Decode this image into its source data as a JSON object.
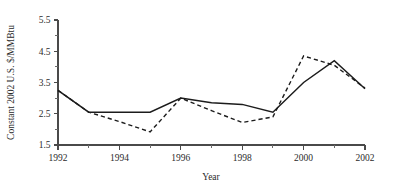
{
  "chart_data": {
    "type": "line",
    "title": "",
    "subtitle": "",
    "xlabel": "Year",
    "ylabel": "Constant 2002 U.S. $/MMBtu",
    "x": [
      1992,
      1993,
      1994,
      1995,
      1996,
      1997,
      1998,
      1999,
      2000,
      2001,
      2002
    ],
    "xlim": [
      1992,
      2002
    ],
    "ylim": [
      1.5,
      5.5
    ],
    "y_ticks": [
      1.5,
      2.5,
      3.5,
      4.5,
      5.5
    ],
    "y_tick_labels": [
      "1.5",
      "2.5",
      "3.5",
      "4.5",
      "5.5"
    ],
    "y_minor_ticks": [
      2.0,
      3.0,
      4.0,
      5.0
    ],
    "x_ticks": [
      1992,
      1994,
      1996,
      1998,
      2000,
      2002
    ],
    "x_tick_labels": [
      "1992",
      "1994",
      "1996",
      "1998",
      "2000",
      "2002"
    ],
    "x_minor_ticks": [
      1993,
      1995,
      1997,
      1999,
      2001
    ],
    "grid": false,
    "legend": null,
    "legend_position": "none",
    "annotations": [],
    "series": [
      {
        "name": "solid-series",
        "style": "solid",
        "color": "#1c1c1c",
        "values": [
          3.25,
          2.55,
          2.55,
          2.55,
          3.0,
          2.85,
          2.8,
          2.55,
          3.5,
          4.2,
          3.3
        ]
      },
      {
        "name": "dashed-series",
        "style": "dashed",
        "color": "#1c1c1c",
        "values": [
          3.25,
          2.55,
          2.25,
          1.92,
          3.0,
          2.6,
          2.22,
          2.4,
          4.35,
          4.05,
          3.32
        ]
      }
    ]
  }
}
